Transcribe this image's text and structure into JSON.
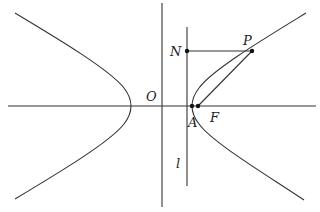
{
  "figure": {
    "type": "hyperbola-diagram",
    "labels": {
      "origin": "O",
      "N": "N",
      "P": "P",
      "A": "A",
      "F": "F",
      "directrix": "l"
    },
    "points": {
      "O": [
        162,
        106
      ],
      "N": [
        187,
        51
      ],
      "P": [
        252,
        51
      ],
      "A": [
        192,
        106
      ],
      "F": [
        198,
        106
      ]
    },
    "colors": {
      "stroke": "#333333",
      "background": "#ffffff"
    }
  }
}
